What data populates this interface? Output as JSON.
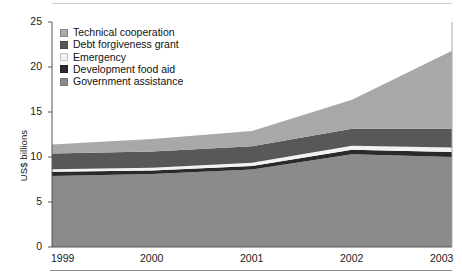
{
  "chart_data": {
    "type": "area",
    "stacked": true,
    "title": "",
    "xlabel": "",
    "ylabel": "US$ billions",
    "x": [
      "1999",
      "2000",
      "2001",
      "2002",
      "2003"
    ],
    "xtick_labels": [
      "1999",
      "2000",
      "2001",
      "2002",
      "2003"
    ],
    "ytick_labels": [
      "0",
      "5",
      "10",
      "15",
      "20",
      "25"
    ],
    "ytick_values": [
      0,
      5,
      10,
      15,
      20,
      25
    ],
    "ylim": [
      0,
      25
    ],
    "grid": false,
    "legend_position": "top-left-inside",
    "series": [
      {
        "name": "Government assistance",
        "color": "#8b8b8b",
        "values": [
          7.9,
          8.1,
          8.6,
          10.3,
          10.0
        ]
      },
      {
        "name": "Development food aid",
        "color": "#2a2a2a",
        "values": [
          0.45,
          0.4,
          0.4,
          0.5,
          0.55
        ]
      },
      {
        "name": "Emergency",
        "color": "#f2f2f2",
        "values": [
          0.3,
          0.3,
          0.35,
          0.45,
          0.5
        ]
      },
      {
        "name": "Debt forgiveness grant",
        "color": "#585858",
        "values": [
          1.75,
          1.8,
          1.85,
          1.9,
          2.1
        ]
      },
      {
        "name": "Technical cooperation",
        "color": "#a8a8a8",
        "values": [
          1.0,
          1.4,
          1.7,
          3.2,
          8.65
        ]
      }
    ],
    "totals": [
      11.4,
      12.0,
      12.9,
      16.35,
      21.8
    ],
    "legend": [
      {
        "label": "Technical cooperation",
        "color": "#a8a8a8"
      },
      {
        "label": "Debt forgiveness grant",
        "color": "#585858"
      },
      {
        "label": "Emergency",
        "color": "#f2f2f2"
      },
      {
        "label": "Development food aid",
        "color": "#2a2a2a"
      },
      {
        "label": "Government assistance",
        "color": "#8b8b8b"
      }
    ]
  },
  "axes": {
    "y_title": "US$ billions",
    "y_ticks": [
      "25",
      "20",
      "15",
      "10",
      "5",
      "0"
    ],
    "x_ticks": [
      "1999",
      "2000",
      "2001",
      "2002",
      "2003"
    ]
  }
}
